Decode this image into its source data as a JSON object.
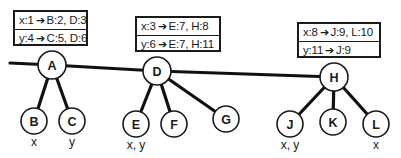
{
  "diagram": {
    "nodes": [
      {
        "id": "A",
        "label": "A",
        "vars": ""
      },
      {
        "id": "B",
        "label": "B",
        "vars": "x"
      },
      {
        "id": "C",
        "label": "C",
        "vars": "y"
      },
      {
        "id": "D",
        "label": "D",
        "vars": ""
      },
      {
        "id": "E",
        "label": "E",
        "vars": "x, y"
      },
      {
        "id": "F",
        "label": "F",
        "vars": ""
      },
      {
        "id": "G",
        "label": "G",
        "vars": ""
      },
      {
        "id": "H",
        "label": "H",
        "vars": ""
      },
      {
        "id": "J",
        "label": "J",
        "vars": "x, y"
      },
      {
        "id": "K",
        "label": "K",
        "vars": ""
      },
      {
        "id": "L",
        "label": "L",
        "vars": "x"
      }
    ],
    "edges": [
      [
        "root",
        "A"
      ],
      [
        "A",
        "D"
      ],
      [
        "D",
        "H"
      ],
      [
        "A",
        "B"
      ],
      [
        "A",
        "C"
      ],
      [
        "D",
        "E"
      ],
      [
        "D",
        "F"
      ],
      [
        "D",
        "G"
      ],
      [
        "H",
        "J"
      ],
      [
        "H",
        "K"
      ],
      [
        "H",
        "L"
      ]
    ],
    "tables": [
      {
        "node": "A",
        "rows": [
          {
            "key": "x:1",
            "arrow": "➔",
            "value": "B:2, D:3"
          },
          {
            "key": "y:4",
            "arrow": "➔",
            "value": "C:5, D:6"
          }
        ]
      },
      {
        "node": "D",
        "rows": [
          {
            "key": "x:3",
            "arrow": "➔",
            "value": "E:7, H:8"
          },
          {
            "key": "y:6",
            "arrow": "➔",
            "value": "E:7, H:11"
          }
        ]
      },
      {
        "node": "H",
        "rows": [
          {
            "key": "x:8",
            "arrow": "➔",
            "value": "J:9, L:10"
          },
          {
            "key": "y:11",
            "arrow": "➔",
            "value": "J:9"
          }
        ]
      }
    ]
  }
}
